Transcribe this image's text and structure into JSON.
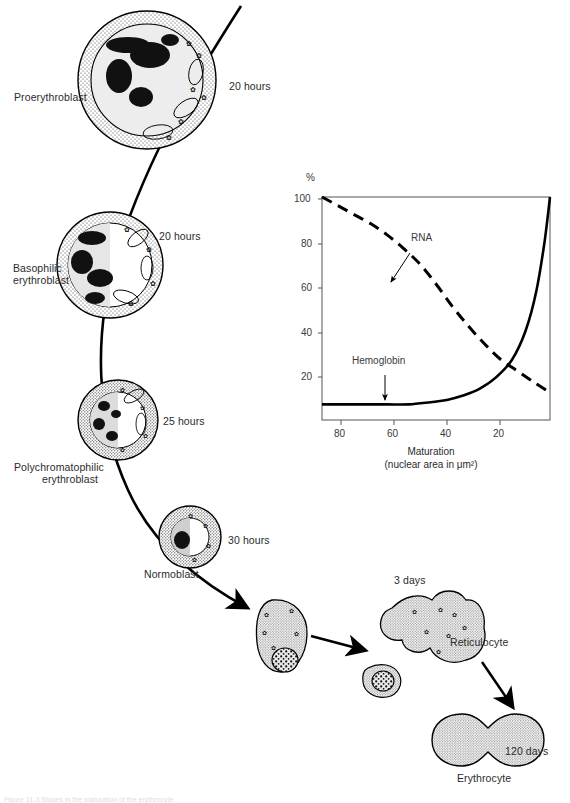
{
  "figure": {
    "caption": "Figure 11-3  Stages in the maturation of the erythrocyte.",
    "stages": [
      {
        "name": "Proerythroblast",
        "duration": "20 hours"
      },
      {
        "name": "Basophilic\nerythroblast",
        "duration": "20 hours"
      },
      {
        "name": "Polychromatophilic\nerythroblast",
        "duration": "25 hours"
      },
      {
        "name": "Normoblast",
        "duration": "30 hours"
      },
      {
        "name": "Reticulocyte",
        "duration": "3 days"
      },
      {
        "name": "Erythrocyte",
        "duration": "120 days"
      }
    ],
    "labels": {
      "proerythroblast": "Proerythroblast",
      "proerythroblast_time": "20 hours",
      "basophilic_l1": "Basophilic",
      "basophilic_l2": "erythroblast",
      "basophilic_time": "20 hours",
      "polychromatophilic_l1": "Polychromatophilic",
      "polychromatophilic_l2": "erythroblast",
      "polychromatophilic_time": "25 hours",
      "normoblast": "Normoblast",
      "normoblast_time": "30 hours",
      "reticulocyte": "Reticulocyte",
      "reticulocyte_time": "3 days",
      "erythrocyte": "Erythrocyte",
      "erythrocyte_time": "120 days"
    }
  },
  "chart_data": {
    "type": "line",
    "title": "",
    "xlabel_line1": "Maturation",
    "xlabel_line2": "(nuclear area in μm²)",
    "ylabel": "%",
    "xlim": [
      88,
      4
    ],
    "ylim": [
      0,
      100
    ],
    "x_reversed": true,
    "grid": false,
    "legend": "inline-annotations",
    "xticks": [
      80,
      60,
      40,
      20
    ],
    "xtick_labels": [
      "80",
      "60",
      "40",
      "20"
    ],
    "yticks": [
      20,
      40,
      60,
      80,
      100
    ],
    "ytick_labels": [
      "20",
      "40",
      "60",
      "80",
      "100"
    ],
    "annotations": [
      {
        "text": "RNA",
        "points_to_series": "RNA",
        "x": 52,
        "y": 70
      },
      {
        "text": "Hemoglobin",
        "points_to_series": "Hemoglobin",
        "x": 60,
        "y": 7
      }
    ],
    "series": [
      {
        "name": "RNA",
        "style": "dashed",
        "x": [
          88,
          82,
          76,
          70,
          64,
          58,
          52,
          46,
          40,
          34,
          28,
          22,
          16,
          10,
          5
        ],
        "values": [
          100,
          96,
          92,
          88,
          83,
          77,
          70,
          61,
          51,
          42,
          34,
          27,
          22,
          17,
          13
        ]
      },
      {
        "name": "Hemoglobin",
        "style": "solid",
        "x": [
          88,
          80,
          72,
          64,
          56,
          48,
          42,
          36,
          30,
          24,
          18,
          13,
          9,
          6,
          4
        ],
        "values": [
          7,
          7,
          7,
          7,
          7,
          8,
          9,
          11,
          14,
          19,
          27,
          40,
          58,
          80,
          100
        ]
      }
    ]
  }
}
